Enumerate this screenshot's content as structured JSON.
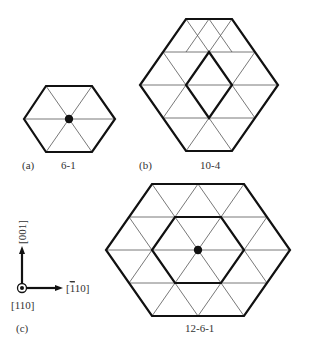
{
  "panels": [
    {
      "id": "a",
      "panel_label": "(a)",
      "caption": "6-1"
    },
    {
      "id": "b",
      "panel_label": "(b)",
      "caption": "10-4"
    },
    {
      "id": "c",
      "panel_label": "(c)",
      "caption": "12-6-1"
    }
  ],
  "axes": {
    "up_label": "[001]",
    "right_label": "[Ī10]",
    "right_label_bar": "1",
    "right_label_rest": "10]",
    "right_label_open": "[",
    "out_of_plane_label": "[110]"
  },
  "colors": {
    "bold_line": "#111111",
    "thin_line": "#555555",
    "dot": "#111111",
    "background": "#ffffff"
  }
}
